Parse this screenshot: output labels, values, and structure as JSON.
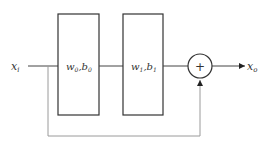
{
  "diagram": {
    "type": "residual-block",
    "input": {
      "label": "x",
      "sub": "i"
    },
    "output": {
      "label": "x",
      "sub": "o"
    },
    "blocks": [
      {
        "w": "w",
        "wsub": "0",
        "b": "b",
        "bsub": "0"
      },
      {
        "w": "w",
        "wsub": "1",
        "b": "b",
        "bsub": "1"
      }
    ],
    "sum_node": {
      "symbol": "+"
    },
    "colors": {
      "stroke": "#333333",
      "skip": "#9a9a9a",
      "background": "#ffffff"
    }
  }
}
